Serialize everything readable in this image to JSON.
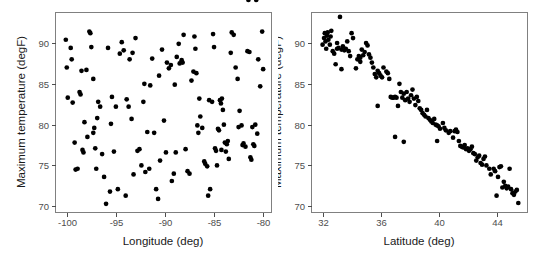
{
  "figure": {
    "background_color": "#ffffff",
    "point_color": "#000000",
    "border_color": "#808080",
    "tick_color": "#4d4d4d",
    "panel_count": 2
  },
  "chart_data": [
    {
      "type": "scatter",
      "panel": "left",
      "title": "",
      "xlabel": "Longitude (deg)",
      "ylabel": "Maximum temperature (degF)",
      "xticks": [
        -100,
        -95,
        -90,
        -85,
        -80
      ],
      "yticks": [
        70,
        75,
        80,
        85,
        90
      ],
      "xlim": [
        -101.2,
        -79.2
      ],
      "ylim": [
        69.3,
        93.8
      ],
      "grid": false,
      "legend": null,
      "x": [
        -100.1,
        -100.0,
        -99.9,
        -99.6,
        -99.5,
        -99.4,
        -99.2,
        -99.1,
        -98.9,
        -98.7,
        -98.6,
        -98.5,
        -98.4,
        -98.3,
        -98.2,
        -98.0,
        -97.9,
        -97.7,
        -97.6,
        -97.5,
        -97.3,
        -97.2,
        -97.1,
        -97.0,
        -96.9,
        -96.6,
        -96.4,
        -96.2,
        -96.0,
        -95.8,
        -95.6,
        -95.5,
        -95.4,
        -95.2,
        -95.0,
        -94.8,
        -94.6,
        -94.4,
        -94.2,
        -94.0,
        -93.9,
        -93.7,
        -93.6,
        -93.4,
        -93.2,
        -93.0,
        -92.8,
        -92.6,
        -92.4,
        -92.2,
        -92.0,
        -91.8,
        -91.6,
        -91.5,
        -91.3,
        -91.1,
        -90.9,
        -90.7,
        -90.5,
        -90.3,
        -90.1,
        -89.9,
        -89.8,
        -89.6,
        -89.4,
        -89.3,
        -89.1,
        -89.0,
        -88.9,
        -88.8,
        -88.6,
        -88.5,
        -88.3,
        -88.1,
        -87.9,
        -87.7,
        -87.5,
        -87.3,
        -87.1,
        -87.0,
        -86.9,
        -86.8,
        -86.6,
        -86.5,
        -86.4,
        -86.2,
        -86.0,
        -85.9,
        -85.7,
        -85.6,
        -85.4,
        -85.2,
        -85.1,
        -85.0,
        -84.9,
        -84.8,
        -84.7,
        -84.6,
        -84.5,
        -84.4,
        -84.3,
        -84.2,
        -84.1,
        -84.0,
        -83.9,
        -83.8,
        -83.6,
        -83.5,
        -83.3,
        -83.2,
        -83.0,
        -82.8,
        -82.6,
        -82.4,
        -82.2,
        -82.1,
        -82.0,
        -81.8,
        -81.6,
        -81.4,
        -81.3,
        -81.2,
        -81.1,
        -81.0,
        -80.9,
        -80.8,
        -80.6,
        -80.5,
        -80.3,
        -80.1,
        -80.0,
        -97.3,
        -96.8,
        -93.3,
        -92.1,
        -90.6,
        -88.2,
        -86.7,
        -85.5,
        -84.25,
        -83.7,
        -82.5,
        -81.5,
        -80.7
      ],
      "y": [
        90.4,
        87.0,
        83.3,
        89.4,
        88.0,
        82.7,
        77.8,
        74.5,
        74.6,
        84.0,
        83.7,
        86.6,
        76.9,
        76.6,
        80.3,
        86.7,
        78.5,
        91.4,
        91.2,
        89.5,
        85.6,
        79.6,
        77.1,
        74.6,
        80.8,
        82.2,
        76.4,
        73.6,
        70.3,
        89.4,
        71.8,
        80.1,
        83.4,
        76.7,
        82.2,
        72.1,
        88.7,
        90.1,
        89.1,
        71.3,
        83.1,
        82.2,
        88.0,
        80.7,
        73.9,
        90.6,
        76.8,
        77.0,
        75.0,
        82.8,
        74.2,
        79.1,
        74.6,
        84.8,
        88.1,
        79.0,
        72.1,
        70.9,
        75.6,
        89.2,
        80.5,
        76.6,
        87.6,
        86.9,
        87.3,
        73.1,
        74.0,
        84.9,
        76.6,
        88.3,
        89.9,
        87.5,
        87.9,
        91.0,
        77.0,
        74.3,
        74.0,
        85.4,
        86.5,
        90.8,
        89.3,
        86.3,
        79.0,
        83.2,
        81.0,
        79.6,
        75.5,
        75.2,
        74.9,
        71.3,
        72.1,
        82.8,
        91.1,
        89.5,
        77.1,
        76.8,
        75.0,
        79.5,
        79.3,
        83.0,
        82.6,
        83.2,
        81.8,
        80.0,
        77.8,
        76.7,
        78.0,
        75.8,
        88.8,
        91.3,
        91.0,
        87.0,
        85.6,
        81.7,
        79.9,
        77.5,
        77.7,
        77.3,
        89.0,
        88.9,
        76.0,
        75.7,
        79.7,
        77.6,
        77.4,
        80.0,
        78.9,
        88.0,
        84.7,
        91.4,
        86.8,
        79.0,
        82.8,
        88.8,
        85.0,
        86.0,
        87.6,
        79.9,
        83.0,
        76.9,
        77.6,
        79.7
      ]
    },
    {
      "type": "scatter",
      "panel": "right",
      "title": "",
      "xlabel": "Latitude (deg)",
      "ylabel": "Maximum temperature (degF)",
      "xticks": [
        32,
        36,
        40,
        44
      ],
      "yticks": [
        70,
        75,
        80,
        85,
        90
      ],
      "xlim": [
        31.2,
        46.1
      ],
      "ylim": [
        69.3,
        93.8
      ],
      "grid": false,
      "legend": null,
      "x": [
        32.0,
        32.1,
        32.15,
        32.2,
        32.25,
        32.3,
        32.35,
        32.4,
        32.5,
        32.55,
        32.6,
        32.7,
        32.8,
        32.9,
        33.0,
        33.1,
        33.2,
        33.3,
        33.4,
        33.5,
        33.6,
        33.7,
        33.8,
        33.9,
        34.0,
        34.1,
        34.3,
        34.4,
        34.5,
        34.6,
        34.7,
        34.8,
        34.9,
        35.0,
        35.1,
        35.2,
        35.3,
        35.4,
        35.5,
        35.6,
        35.7,
        35.8,
        35.9,
        36.0,
        36.1,
        36.2,
        36.4,
        36.5,
        36.6,
        36.7,
        36.8,
        36.9,
        37.0,
        37.1,
        37.2,
        37.3,
        37.4,
        37.5,
        37.6,
        37.7,
        37.8,
        37.9,
        38.0,
        38.1,
        38.2,
        38.3,
        38.4,
        38.5,
        38.6,
        38.7,
        38.8,
        38.9,
        39.0,
        39.1,
        39.2,
        39.3,
        39.4,
        39.5,
        39.6,
        39.7,
        39.8,
        39.9,
        40.0,
        40.1,
        40.3,
        40.4,
        40.5,
        40.7,
        40.8,
        41.0,
        41.1,
        41.2,
        41.3,
        41.4,
        41.5,
        41.6,
        41.7,
        41.8,
        41.9,
        42.0,
        42.1,
        42.2,
        42.3,
        42.4,
        42.5,
        42.6,
        42.7,
        42.8,
        42.9,
        43.0,
        43.1,
        43.2,
        43.3,
        43.5,
        43.6,
        43.8,
        43.9,
        44.0,
        44.1,
        44.2,
        44.3,
        44.4,
        44.5,
        44.6,
        44.7,
        44.8,
        44.9,
        45.0,
        45.1,
        45.2,
        45.3,
        45.4,
        45.5,
        33.3,
        35.8,
        37.0,
        37.6,
        39.9,
        33.0,
        34.6
      ],
      "y": [
        89.8,
        90.6,
        91.2,
        90.2,
        89.3,
        90.9,
        91.3,
        90.4,
        89.8,
        90.8,
        91.5,
        89.0,
        88.7,
        87.4,
        89.3,
        89.4,
        93.2,
        89.2,
        89.6,
        89.1,
        89.3,
        90.2,
        89.0,
        88.4,
        91.2,
        90.6,
        86.9,
        88.0,
        88.4,
        87.7,
        89.2,
        88.5,
        88.9,
        90.0,
        89.7,
        88.6,
        88.2,
        87.6,
        87.0,
        86.2,
        85.8,
        86.6,
        86.3,
        86.0,
        85.8,
        87.0,
        86.5,
        86.3,
        85.6,
        83.4,
        83.3,
        83.3,
        83.4,
        83.3,
        82.3,
        85.0,
        84.0,
        83.3,
        83.8,
        83.0,
        84.0,
        83.2,
        82.8,
        83.6,
        84.3,
        83.2,
        82.4,
        83.4,
        82.9,
        82.0,
        81.8,
        81.4,
        81.2,
        81.0,
        81.8,
        80.8,
        80.6,
        80.4,
        80.2,
        80.7,
        80.0,
        79.9,
        79.8,
        79.5,
        80.2,
        79.6,
        79.3,
        79.0,
        79.2,
        78.4,
        79.2,
        79.4,
        79.1,
        78.0,
        77.4,
        77.3,
        77.2,
        77.5,
        77.0,
        77.1,
        76.8,
        77.0,
        77.3,
        76.5,
        76.4,
        75.6,
        76.0,
        76.2,
        75.3,
        75.1,
        75.8,
        76.1,
        75.0,
        74.6,
        73.9,
        74.6,
        74.3,
        71.3,
        73.6,
        74.8,
        74.9,
        72.3,
        73.0,
        72.5,
        72.2,
        72.4,
        74.6,
        72.1,
        71.6,
        71.4,
        71.8,
        72.0,
        70.4,
        86.8,
        82.3,
        78.5,
        77.9,
        78.0,
        90.0,
        88.2
      ]
    }
  ]
}
